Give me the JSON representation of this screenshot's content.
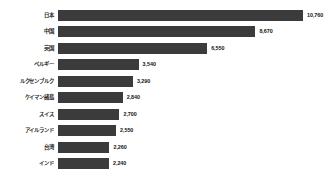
{
  "chart_data": {
    "type": "bar",
    "orientation": "horizontal",
    "title": "",
    "subtitle": "",
    "xlabel": "",
    "ylabel": "",
    "grid": false,
    "legend": false,
    "axis_visible": false,
    "bar_color": "#3b3b3b",
    "background_color": "#ffffff",
    "value_format": "comma-separated integer",
    "xlim": [
      0,
      10760
    ],
    "categories": [
      "日本",
      "中国",
      "英国",
      "ベルギー",
      "ルクセンブルク",
      "ケイマン諸島",
      "スイス",
      "アイルランド",
      "台湾",
      "インド"
    ],
    "values": [
      10760,
      8670,
      6550,
      3540,
      3290,
      2840,
      2700,
      2550,
      2260,
      2240
    ],
    "value_labels": [
      "10,760",
      "8,670",
      "6,550",
      "3,540",
      "3,290",
      "2,840",
      "2,700",
      "2,550",
      "2,260",
      "2,240"
    ]
  },
  "footnote": {
    "text": ""
  }
}
